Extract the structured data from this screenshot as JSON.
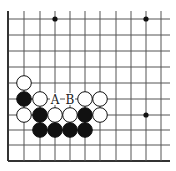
{
  "board": {
    "columns_x": [
      8,
      24,
      40,
      55,
      70,
      85,
      100,
      116,
      131,
      146,
      161
    ],
    "rows_y": [
      19,
      35,
      51,
      67,
      83,
      99,
      115,
      130,
      145,
      161
    ],
    "line_color": "#555555",
    "edge_color": "#333333"
  },
  "star_points": [
    {
      "col": 3,
      "row": 0
    },
    {
      "col": 9,
      "row": 0
    },
    {
      "col": 9,
      "row": 6
    }
  ],
  "stones": [
    {
      "color": "white",
      "col": 1,
      "row": 4
    },
    {
      "color": "black",
      "col": 1,
      "row": 5
    },
    {
      "color": "white",
      "col": 2,
      "row": 5
    },
    {
      "color": "white",
      "col": 5,
      "row": 5
    },
    {
      "color": "white",
      "col": 6,
      "row": 5
    },
    {
      "color": "white",
      "col": 1,
      "row": 6
    },
    {
      "color": "black",
      "col": 2,
      "row": 6
    },
    {
      "color": "white",
      "col": 3,
      "row": 6
    },
    {
      "color": "white",
      "col": 4,
      "row": 6
    },
    {
      "color": "black",
      "col": 5,
      "row": 6
    },
    {
      "color": "white",
      "col": 6,
      "row": 6
    },
    {
      "color": "black",
      "col": 2,
      "row": 7
    },
    {
      "color": "black",
      "col": 3,
      "row": 7
    },
    {
      "color": "black",
      "col": 4,
      "row": 7
    },
    {
      "color": "black",
      "col": 5,
      "row": 7
    }
  ],
  "labels": [
    {
      "text": "A",
      "col": 3,
      "row": 5
    },
    {
      "text": "B",
      "col": 4,
      "row": 5
    }
  ]
}
